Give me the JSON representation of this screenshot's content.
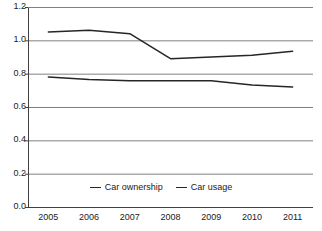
{
  "chart_data": {
    "type": "line",
    "title": "",
    "subtitle": "",
    "xlabel": "",
    "ylabel": "",
    "categories": [
      "2005",
      "2006",
      "2007",
      "2008",
      "2009",
      "2010",
      "2011"
    ],
    "x": [
      2005,
      2006,
      2007,
      2008,
      2009,
      2010,
      2011
    ],
    "series": [
      {
        "name": "Car ownership",
        "color": "#262626",
        "values": [
          1.05,
          1.06,
          1.04,
          0.89,
          0.9,
          0.91,
          0.935
        ]
      },
      {
        "name": "Car usage",
        "color": "#262626",
        "values": [
          0.78,
          0.765,
          0.757,
          0.757,
          0.758,
          0.732,
          0.72
        ]
      }
    ],
    "ylim": [
      0.0,
      1.2
    ],
    "yticks": [
      0.0,
      0.2,
      0.4,
      0.6,
      0.8,
      1.0,
      1.2
    ],
    "ytick_labels": [
      "0.0",
      "0.2",
      "0.4",
      "0.6",
      "0.8",
      "1.0",
      "1.2"
    ],
    "grid": true,
    "grid_axis": "y",
    "grid_color": "#808080",
    "legend": true,
    "legend_position": "bottom",
    "axis_color": "#404040",
    "background": "#ffffff"
  },
  "legend": {
    "entries": [
      {
        "label": "Car ownership"
      },
      {
        "label": "Car usage"
      }
    ]
  },
  "icons": {
    "legend_line": "line-swatch-icon"
  }
}
